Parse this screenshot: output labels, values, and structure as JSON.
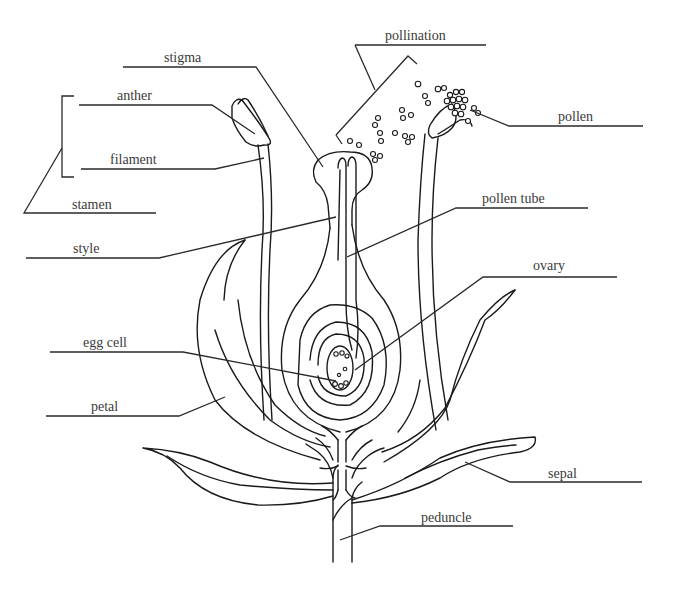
{
  "diagram": {
    "labels": {
      "stigma": "stigma",
      "pollination": "pollination",
      "anther": "anther",
      "pollen": "pollen",
      "filament": "filament",
      "stamen": "stamen",
      "pollen_tube": "pollen tube",
      "style": "style",
      "ovary": "ovary",
      "egg_cell": "egg cell",
      "petal": "petal",
      "sepal": "sepal",
      "peduncle": "peduncle"
    },
    "colors": {
      "line": "#1a1a1a",
      "text": "#3a3a3a",
      "background": "#ffffff"
    }
  }
}
